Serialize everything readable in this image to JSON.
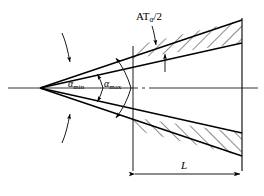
{
  "figure": {
    "background": "#ffffff",
    "line_color": "#000000",
    "centerline_color": "#000000",
    "labels": {
      "tolerance": {
        "base": "AT",
        "subscript": "α",
        "suffix": "/2",
        "full": "ATα/2"
      },
      "angle_min": {
        "base": "α",
        "subscript": "min",
        "full": "αmin"
      },
      "angle_max": {
        "base": "α",
        "subscript": "max",
        "full": "αmax"
      },
      "length": {
        "full": "L"
      }
    },
    "geometry": {
      "apex_x": 40,
      "apex_y": 88,
      "left_axis_x": 8,
      "station_x": 133,
      "end_x": 242,
      "top_outer_y_end": 20,
      "top_inner_y_end": 43,
      "bottom_inner_y_end": 133,
      "bottom_outer_y_end": 156,
      "dimension_line_y": 174
    }
  }
}
